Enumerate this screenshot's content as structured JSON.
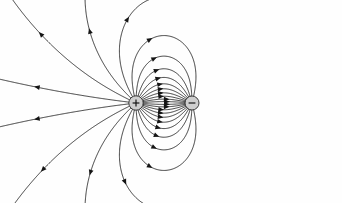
{
  "figure": {
    "type": "field-line-diagram",
    "width": 342,
    "height": 203,
    "background_color": "#fefefe",
    "line_color": "#1b1b1b",
    "arrow_color": "#141414"
  },
  "chart_data": {
    "type": "scatter",
    "subtitle": "",
    "xlabel": "",
    "ylabel": "",
    "xlim": [
      0,
      342
    ],
    "ylim": [
      0,
      203
    ],
    "grid": false,
    "legend": "none",
    "annotations": [],
    "charges": [
      {
        "name": "positive-charge",
        "sign": "+",
        "symbol": "+",
        "magnitude": 1,
        "x": 136,
        "y": 103,
        "radius": 7.2,
        "fill_color": "#cfcfcf",
        "edge_color": "#2b2b2b"
      },
      {
        "name": "negative-charge",
        "sign": "-",
        "symbol": "−",
        "magnitude": -1,
        "x": 192,
        "y": 103,
        "radius": 7.0,
        "fill_color": "#cfcfcf",
        "edge_color": "#2b2b2b"
      }
    ],
    "field": {
      "model": "point-dipole",
      "separation_px": 56,
      "axis_y": 103,
      "seed_angles_deg": [
        4,
        11,
        19,
        28,
        38,
        49,
        61,
        74,
        88,
        103,
        119,
        136,
        154,
        173
      ],
      "mirror_vertical": true,
      "lines_per_quadrant": 14,
      "total_lines": 28,
      "direction": "from positive to negative",
      "escaping_lines_count": 12,
      "closed_loop_count": 16
    },
    "arrows": {
      "style": "filled-triangle",
      "length_px": 5.6,
      "half_width_px": 2.4,
      "count_per_line": 1,
      "direction_note": "arrowheads point along field direction, away from + and toward −"
    }
  }
}
